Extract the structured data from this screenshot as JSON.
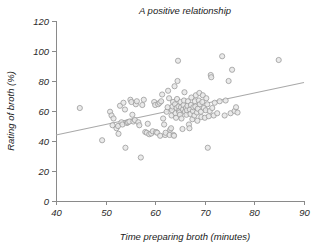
{
  "chart_data": {
    "type": "scatter",
    "title": "A positive relationship",
    "xlabel": "Time preparing broth (minutes)",
    "ylabel": "Rating of broth (%)",
    "xlim": [
      40,
      90
    ],
    "ylim": [
      0,
      120
    ],
    "xticks": [
      40,
      50,
      60,
      70,
      80,
      90
    ],
    "yticks": [
      0,
      20,
      40,
      60,
      80,
      100,
      120
    ],
    "grid": false,
    "legend": null,
    "marker": {
      "shape": "circle",
      "radius": 2.6,
      "fill": "#e6e6e6",
      "stroke": "#9b9b9b"
    },
    "trend_line": {
      "label": "linear fit",
      "color": "#a9a9a9",
      "x": [
        40,
        90
      ],
      "y": [
        44,
        79
      ]
    },
    "points": [
      [
        44.8,
        62.0
      ],
      [
        49.3,
        40.5
      ],
      [
        50.9,
        59.5
      ],
      [
        51.2,
        57.0
      ],
      [
        51.4,
        50.5
      ],
      [
        51.6,
        55.0
      ],
      [
        52.2,
        48.5
      ],
      [
        52.5,
        50.0
      ],
      [
        52.6,
        44.8
      ],
      [
        52.9,
        63.5
      ],
      [
        53.2,
        52.5
      ],
      [
        53.4,
        51.0
      ],
      [
        53.6,
        65.5
      ],
      [
        53.9,
        61.0
      ],
      [
        54.0,
        35.5
      ],
      [
        54.3,
        52.0
      ],
      [
        54.5,
        52.5
      ],
      [
        54.8,
        53.0
      ],
      [
        55.0,
        67.5
      ],
      [
        55.2,
        66.0
      ],
      [
        55.4,
        57.5
      ],
      [
        55.6,
        53.0
      ],
      [
        55.9,
        54.0
      ],
      [
        56.1,
        64.5
      ],
      [
        56.3,
        66.5
      ],
      [
        56.6,
        52.5
      ],
      [
        56.8,
        50.5
      ],
      [
        57.1,
        29.0
      ],
      [
        57.4,
        64.0
      ],
      [
        57.7,
        67.5
      ],
      [
        58.0,
        46.0
      ],
      [
        58.3,
        45.5
      ],
      [
        58.5,
        51.5
      ],
      [
        58.8,
        44.5
      ],
      [
        59.2,
        45.0
      ],
      [
        59.5,
        46.5
      ],
      [
        59.8,
        66.0
      ],
      [
        60.0,
        64.0
      ],
      [
        60.2,
        46.0
      ],
      [
        60.4,
        45.5
      ],
      [
        60.6,
        64.5
      ],
      [
        60.9,
        65.5
      ],
      [
        61.0,
        43.5
      ],
      [
        61.2,
        66.5
      ],
      [
        61.4,
        71.0
      ],
      [
        61.6,
        55.0
      ],
      [
        61.8,
        51.0
      ],
      [
        62.0,
        44.0
      ],
      [
        62.1,
        45.5
      ],
      [
        62.3,
        59.5
      ],
      [
        62.5,
        62.5
      ],
      [
        62.6,
        73.5
      ],
      [
        62.8,
        68.5
      ],
      [
        62.9,
        44.0
      ],
      [
        63.0,
        47.5
      ],
      [
        63.2,
        48.5
      ],
      [
        63.3,
        57.0
      ],
      [
        63.4,
        60.5
      ],
      [
        63.5,
        63.0
      ],
      [
        63.6,
        66.0
      ],
      [
        63.7,
        44.0
      ],
      [
        63.8,
        43.5
      ],
      [
        63.9,
        76.5
      ],
      [
        64.0,
        64.5
      ],
      [
        64.1,
        58.5
      ],
      [
        64.2,
        55.5
      ],
      [
        64.3,
        62.0
      ],
      [
        64.4,
        68.0
      ],
      [
        64.5,
        80.0
      ],
      [
        64.6,
        93.5
      ],
      [
        64.7,
        63.0
      ],
      [
        64.8,
        60.0
      ],
      [
        64.9,
        59.0
      ],
      [
        65.0,
        57.5
      ],
      [
        65.1,
        66.0
      ],
      [
        65.2,
        62.5
      ],
      [
        65.3,
        55.0
      ],
      [
        65.5,
        48.0
      ],
      [
        65.6,
        61.0
      ],
      [
        65.7,
        64.0
      ],
      [
        65.8,
        67.0
      ],
      [
        65.9,
        72.5
      ],
      [
        66.0,
        59.5
      ],
      [
        66.2,
        62.0
      ],
      [
        66.3,
        57.5
      ],
      [
        66.4,
        60.5
      ],
      [
        66.5,
        63.5
      ],
      [
        66.6,
        66.5
      ],
      [
        66.8,
        51.0
      ],
      [
        66.9,
        48.5
      ],
      [
        67.0,
        61.0
      ],
      [
        67.1,
        58.0
      ],
      [
        67.2,
        64.0
      ],
      [
        67.3,
        69.0
      ],
      [
        67.5,
        54.5
      ],
      [
        67.6,
        60.0
      ],
      [
        67.7,
        62.5
      ],
      [
        67.9,
        57.0
      ],
      [
        68.0,
        66.5
      ],
      [
        68.1,
        63.0
      ],
      [
        68.2,
        70.5
      ],
      [
        68.4,
        59.0
      ],
      [
        68.5,
        53.5
      ],
      [
        68.6,
        61.5
      ],
      [
        68.8,
        67.0
      ],
      [
        68.9,
        72.0
      ],
      [
        69.0,
        64.5
      ],
      [
        69.2,
        59.5
      ],
      [
        69.3,
        56.0
      ],
      [
        69.5,
        66.0
      ],
      [
        69.6,
        70.5
      ],
      [
        69.8,
        62.0
      ],
      [
        70.0,
        55.5
      ],
      [
        70.2,
        60.5
      ],
      [
        70.3,
        68.5
      ],
      [
        70.5,
        64.5
      ],
      [
        70.6,
        35.5
      ],
      [
        70.8,
        56.5
      ],
      [
        71.0,
        60.0
      ],
      [
        71.2,
        84.0
      ],
      [
        71.3,
        82.5
      ],
      [
        71.5,
        62.0
      ],
      [
        71.8,
        57.0
      ],
      [
        72.0,
        65.5
      ],
      [
        72.5,
        58.5
      ],
      [
        73.0,
        66.5
      ],
      [
        73.5,
        96.5
      ],
      [
        74.0,
        57.0
      ],
      [
        74.2,
        67.0
      ],
      [
        74.8,
        80.0
      ],
      [
        75.2,
        58.5
      ],
      [
        75.5,
        87.5
      ],
      [
        76.0,
        60.0
      ],
      [
        76.3,
        62.5
      ],
      [
        76.6,
        59.0
      ],
      [
        84.9,
        94.0
      ]
    ]
  }
}
